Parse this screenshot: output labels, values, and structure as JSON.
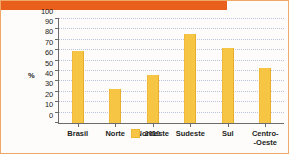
{
  "chart_data": {
    "type": "bar",
    "title": "",
    "xlabel": "",
    "ylabel": "%",
    "categories": [
      "Brasil",
      "Norte",
      "Nordeste",
      "Sudeste",
      "Sul",
      "Centro--Oeste"
    ],
    "category_lines": [
      [
        "Brasil"
      ],
      [
        "Norte"
      ],
      [
        "Nordeste"
      ],
      [
        "Sudeste"
      ],
      [
        "Sul"
      ],
      [
        "Centro-",
        "-Oeste"
      ]
    ],
    "values": [
      69,
      33,
      46,
      86,
      72,
      53
    ],
    "ylim": [
      0,
      100
    ],
    "yticks": [
      0,
      10,
      20,
      30,
      40,
      50,
      60,
      70,
      80,
      90,
      100
    ],
    "ytick_labels": [
      "0",
      "10",
      "20",
      "30",
      "40",
      "50",
      "60",
      "70",
      "80",
      "90",
      "100"
    ],
    "grid": true,
    "legend_position": "bottom",
    "series": [
      {
        "name": "2010",
        "values": [
          69,
          33,
          46,
          86,
          72,
          53
        ],
        "color": "#F7C544"
      }
    ]
  },
  "legend": {
    "label": "2010"
  },
  "colors": {
    "bar": "#F7C544",
    "banner": "#E8601C",
    "border": "#F0A868",
    "grid": "#B9C4DD",
    "axis": "#6B6B6B"
  }
}
